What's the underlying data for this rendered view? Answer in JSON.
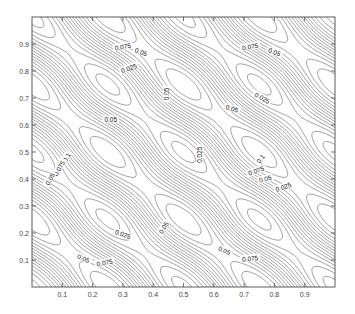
{
  "chart_data": {
    "type": "contour",
    "title": "",
    "xlabel": "",
    "ylabel": "",
    "xlim": [
      0,
      1
    ],
    "ylim": [
      0,
      1
    ],
    "grid": false,
    "legend": null,
    "x_ticks": [
      "0.1",
      "0.2",
      "0.3",
      "0.4",
      "0.5",
      "0.6",
      "0.7",
      "0.8",
      "0.9"
    ],
    "y_ticks": [
      "0.1",
      "0.2",
      "0.3",
      "0.4",
      "0.5",
      "0.6",
      "0.7",
      "0.8",
      "0.9"
    ],
    "contour_levels_labeled": [
      "0.025",
      "0.05",
      "0.075",
      "0.1"
    ],
    "minima_centers": [
      [
        0.25,
        0.25
      ],
      [
        0.5,
        0.25
      ],
      [
        0.75,
        0.25
      ],
      [
        0.25,
        0.5
      ],
      [
        0.5,
        0.5
      ],
      [
        0.75,
        0.5
      ],
      [
        0.25,
        0.75
      ],
      [
        0.5,
        0.75
      ],
      [
        0.75,
        0.75
      ]
    ],
    "contour_labels": [
      {
        "text": "0.075",
        "x": 0.3,
        "y": 0.89,
        "rotate": 10
      },
      {
        "text": "0.05",
        "x": 0.36,
        "y": 0.87,
        "rotate": -20
      },
      {
        "text": "0.025",
        "x": 0.32,
        "y": 0.81,
        "rotate": 20
      },
      {
        "text": "0.05",
        "x": 0.26,
        "y": 0.62,
        "rotate": 0
      },
      {
        "text": "0.05",
        "x": 0.445,
        "y": 0.715,
        "rotate": 90
      },
      {
        "text": "0.075",
        "x": 0.72,
        "y": 0.89,
        "rotate": 10
      },
      {
        "text": "0.05",
        "x": 0.8,
        "y": 0.87,
        "rotate": -20
      },
      {
        "text": "0.025",
        "x": 0.76,
        "y": 0.7,
        "rotate": -30
      },
      {
        "text": "0.05",
        "x": 0.66,
        "y": 0.66,
        "rotate": -15
      },
      {
        "text": "0.1",
        "x": 0.115,
        "y": 0.48,
        "rotate": 60
      },
      {
        "text": "0.075",
        "x": 0.09,
        "y": 0.44,
        "rotate": 60
      },
      {
        "text": "0.05",
        "x": 0.06,
        "y": 0.4,
        "rotate": 60
      },
      {
        "text": "0.025",
        "x": 0.555,
        "y": 0.49,
        "rotate": 90
      },
      {
        "text": "0.05",
        "x": 0.435,
        "y": 0.22,
        "rotate": 60
      },
      {
        "text": "0.025",
        "x": 0.3,
        "y": 0.195,
        "rotate": -20
      },
      {
        "text": "0.05",
        "x": 0.17,
        "y": 0.105,
        "rotate": -25
      },
      {
        "text": "0.075",
        "x": 0.24,
        "y": 0.09,
        "rotate": 10
      },
      {
        "text": "0.1",
        "x": 0.755,
        "y": 0.475,
        "rotate": 50
      },
      {
        "text": "0.075",
        "x": 0.74,
        "y": 0.43,
        "rotate": 20
      },
      {
        "text": "0.05",
        "x": 0.77,
        "y": 0.4,
        "rotate": 15
      },
      {
        "text": "0.025",
        "x": 0.83,
        "y": 0.37,
        "rotate": 20
      },
      {
        "text": "0.05",
        "x": 0.635,
        "y": 0.135,
        "rotate": -25
      },
      {
        "text": "0.075",
        "x": 0.72,
        "y": 0.105,
        "rotate": 5
      }
    ]
  },
  "axes": {
    "x_tick_values": [
      0.1,
      0.2,
      0.3,
      0.4,
      0.5,
      0.6,
      0.7,
      0.8,
      0.9
    ],
    "y_tick_values": [
      0.1,
      0.2,
      0.3,
      0.4,
      0.5,
      0.6,
      0.7,
      0.8,
      0.9
    ]
  },
  "colors": {
    "line": "#555555",
    "frame": "#333333",
    "text": "#444444"
  }
}
